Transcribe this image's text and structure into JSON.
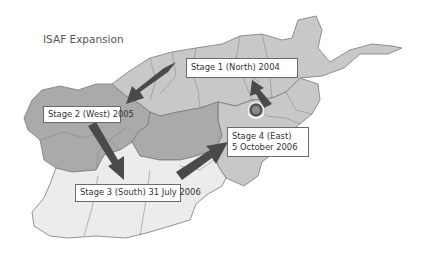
{
  "title": "ISAF Expansion",
  "colors": {
    "background": "#ffffff",
    "stage_north_east": "#c8c8c8",
    "stage_west": "#aaaaaa",
    "stage_south": "#ececec",
    "border": "#7a7a7a",
    "arrow": "#4a4a4a",
    "label_border": "#6a6a6a"
  },
  "stages": [
    {
      "id": "stage-1",
      "label": "Stage 1 (North) 2004",
      "region": "North"
    },
    {
      "id": "stage-2",
      "label": "Stage 2 (West) 2005",
      "region": "West"
    },
    {
      "id": "stage-3",
      "label": "Stage 3 (South) 31 July 2006",
      "region": "South"
    },
    {
      "id": "stage-4",
      "line1": "Stage 4 (East)",
      "line2": "5 October 2006",
      "region": "East"
    }
  ],
  "emblem": {
    "icon": "isaf-emblem-icon"
  }
}
